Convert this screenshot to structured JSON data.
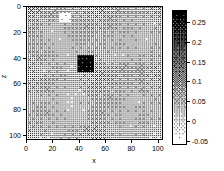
{
  "figure": {
    "background": "#ffffff",
    "width": 224,
    "height": 171
  },
  "axes": {
    "x": {
      "label": "x",
      "ticks": [
        0,
        20,
        40,
        60,
        80,
        100
      ],
      "tick_labels": [
        "0",
        "20",
        "40",
        "60",
        "80",
        "100"
      ],
      "lim": [
        0,
        104
      ],
      "direction": "normal"
    },
    "z": {
      "label": "z",
      "ticks": [
        0,
        20,
        40,
        60,
        80,
        100
      ],
      "tick_labels": [
        "0",
        "20",
        "40",
        "60",
        "80",
        "100"
      ],
      "lim": [
        0,
        104
      ],
      "direction": "inverted"
    }
  },
  "colorbar": {
    "orientation": "vertical",
    "position": "right",
    "ticks": [
      0.25,
      0.2,
      0.15,
      0.1,
      0.05,
      0,
      -0.05
    ],
    "tick_labels": [
      "0.25",
      "0.2",
      "0.15",
      "0.1",
      "0.05",
      "0",
      "-0.05"
    ],
    "vmin": -0.06,
    "vmax": 0.28,
    "colormap": "gray-reversed",
    "high_color": "#000000",
    "low_color": "#ffffff"
  },
  "chart_data": {
    "type": "heatmap",
    "title": "",
    "xlabel": "x",
    "ylabel": "z",
    "xlim": [
      0,
      104
    ],
    "ylim": [
      104,
      0
    ],
    "grid": false,
    "legend": "colorbar-right",
    "colormap": "gray-reversed",
    "vmin": -0.06,
    "vmax": 0.28,
    "colorbar_ticks": [
      0.25,
      0.2,
      0.15,
      0.1,
      0.05,
      0,
      -0.05
    ],
    "x_ticks": [
      0,
      20,
      40,
      60,
      80,
      100
    ],
    "y_ticks": [
      0,
      20,
      40,
      60,
      80,
      100
    ],
    "grid_shape": [
      104,
      104
    ],
    "background_value_mean": 0.035,
    "background_value_range": [
      0.005,
      0.075
    ],
    "texture": "dithered-halftone-noise",
    "features": [
      {
        "name": "high-anomaly-block",
        "shape": "rectangle",
        "x_range": [
          38,
          50
        ],
        "z_range": [
          38,
          50
        ],
        "value": 0.27,
        "description": "solid dark square anomaly near plot center"
      },
      {
        "name": "low-anomaly-patch",
        "shape": "rectangle",
        "x_range": [
          25,
          33
        ],
        "z_range": [
          4,
          11
        ],
        "value": -0.05,
        "description": "bright white low-value patch near top"
      },
      {
        "name": "faint-dark-blob",
        "shape": "rectangle",
        "x_range": [
          84,
          93
        ],
        "z_range": [
          61,
          70
        ],
        "value": 0.085,
        "description": "subtle darker region in lower-right quadrant"
      },
      {
        "name": "light-band-lower-mid",
        "shape": "rectangle",
        "x_range": [
          36,
          50
        ],
        "z_range": [
          72,
          86
        ],
        "value": 0.012,
        "description": "lighter vertical band below center"
      }
    ]
  }
}
